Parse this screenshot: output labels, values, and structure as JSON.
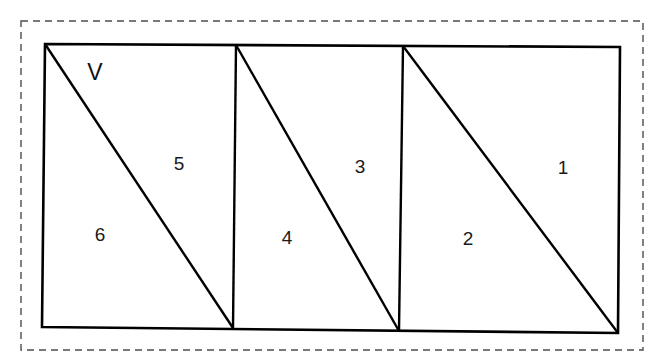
{
  "figure": {
    "caption_text": "",
    "background_color": "#ffffff",
    "stroke_color": "#000000",
    "dashed_border_color": "#4d4d4d",
    "label_color": "#1a1a1a",
    "outer_border": {
      "style": "dashed",
      "x": 21,
      "y": 21,
      "width": 622,
      "height": 329,
      "dash_length": 7,
      "dash_gap": 5,
      "stroke_width": 1.4
    },
    "outline": {
      "name": "outer-rectangle",
      "stroke_width": 2.6,
      "points": [
        {
          "x": 45,
          "y": 44
        },
        {
          "x": 620,
          "y": 47
        },
        {
          "x": 618,
          "y": 333
        },
        {
          "x": 42,
          "y": 327
        }
      ]
    },
    "dividers": [
      {
        "name": "vertical-divider-1",
        "x1": 236,
        "y1": 45,
        "x2": 233,
        "y2": 328,
        "stroke_width": 2.4
      },
      {
        "name": "vertical-divider-2",
        "x1": 403,
        "y1": 46,
        "x2": 399,
        "y2": 331,
        "stroke_width": 2.4
      }
    ],
    "diagonals": [
      {
        "name": "diagonal-left",
        "x1": 45,
        "y1": 44,
        "x2": 233,
        "y2": 328,
        "stroke_width": 2.4
      },
      {
        "name": "diagonal-middle",
        "x1": 236,
        "y1": 45,
        "x2": 399,
        "y2": 331,
        "stroke_width": 2.4
      },
      {
        "name": "diagonal-right",
        "x1": 403,
        "y1": 46,
        "x2": 618,
        "y2": 333,
        "stroke_width": 2.4
      }
    ],
    "region_labels": [
      {
        "id": "region-6",
        "text": "6",
        "x": 100,
        "y": 234
      },
      {
        "id": "region-5",
        "text": "5",
        "x": 179,
        "y": 163
      },
      {
        "id": "region-4",
        "text": "4",
        "x": 287,
        "y": 237
      },
      {
        "id": "region-3",
        "text": "3",
        "x": 360,
        "y": 166
      },
      {
        "id": "region-2",
        "text": "2",
        "x": 468,
        "y": 238
      },
      {
        "id": "region-1",
        "text": "1",
        "x": 563,
        "y": 167
      }
    ],
    "vertex_labels": [
      {
        "id": "vertex-v",
        "text": "V",
        "x": 95,
        "y": 72
      }
    ]
  }
}
